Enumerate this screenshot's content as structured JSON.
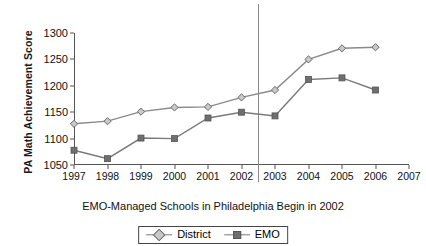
{
  "chart_data": {
    "type": "line",
    "title": "",
    "subtitle": "",
    "caption": "EMO-Managed Schools in Philadelphia Begin in 2002",
    "xlabel": "",
    "ylabel": "PA Math Achievement Score",
    "categories": [
      1997,
      1998,
      1999,
      2000,
      2001,
      2002,
      2003,
      2004,
      2005,
      2006,
      2007
    ],
    "x_tick_labels": [
      "1997",
      "1998",
      "1999",
      "2000",
      "2001",
      "2002",
      "2003",
      "2004",
      "2005",
      "2006",
      "2007"
    ],
    "y_tick_labels": [
      "1050",
      "1100",
      "1150",
      "1200",
      "1250",
      "1300"
    ],
    "y_ticks": [
      1050,
      1100,
      1150,
      1200,
      1250,
      1300
    ],
    "ylim": [
      1050,
      1300
    ],
    "xlim": [
      1997,
      2007
    ],
    "grid": false,
    "legend_position": "bottom-center",
    "series": [
      {
        "name": "District",
        "marker": "diamond",
        "color": "#8a8a8a",
        "x": [
          1997,
          1998,
          1999,
          2000,
          2001,
          2002,
          2003,
          2004,
          2005,
          2006
        ],
        "values": [
          1128,
          1133,
          1151,
          1159,
          1160,
          1178,
          1192,
          1250,
          1271,
          1273
        ]
      },
      {
        "name": "EMO",
        "marker": "square",
        "color": "#7a7a7a",
        "x": [
          1997,
          1998,
          1999,
          2000,
          2001,
          2002,
          2003,
          2004,
          2005,
          2006
        ],
        "values": [
          1078,
          1062,
          1101,
          1100,
          1139,
          1150,
          1143,
          1212,
          1215,
          1192
        ]
      }
    ],
    "annotations": [
      {
        "type": "vertical-line",
        "label": "EMO start boundary",
        "x": 2002.5,
        "color": "#8a8a8a"
      }
    ]
  },
  "legend": {
    "items": [
      {
        "label": "District",
        "marker": "diamond"
      },
      {
        "label": "EMO",
        "marker": "square"
      }
    ]
  }
}
